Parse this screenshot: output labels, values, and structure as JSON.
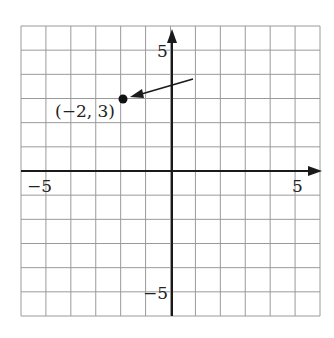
{
  "chart_data": {
    "type": "scatter",
    "title": "",
    "xlabel": "",
    "ylabel": "",
    "xlim": [
      -6,
      6
    ],
    "ylim": [
      -6,
      6
    ],
    "grid": true,
    "grid_step": 1,
    "x_tick_labels": [
      {
        "value": -5,
        "label": "−5"
      },
      {
        "value": 5,
        "label": "5"
      }
    ],
    "y_tick_labels": [
      {
        "value": 5,
        "label": "5"
      },
      {
        "value": -5,
        "label": "−5"
      }
    ],
    "points": [
      {
        "x": -2,
        "y": 3,
        "label": "(−2, 3)"
      }
    ],
    "annotations": [
      {
        "type": "arrow",
        "from": [
          0.9,
          3.8
        ],
        "to": [
          -1.7,
          3.05
        ],
        "target_label": "(−2, 3)"
      }
    ],
    "axes": {
      "x_arrow": true,
      "y_arrow": true
    }
  },
  "labels": {
    "x_neg": "−5",
    "x_pos": "5",
    "y_pos": "5",
    "y_neg": "−5",
    "point": "(−2, 3)"
  },
  "colors": {
    "grid": "#9a9a9a",
    "axis": "#1a1a1a",
    "point": "#111111"
  }
}
